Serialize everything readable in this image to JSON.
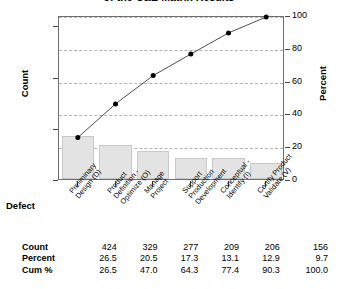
{
  "chart_data": {
    "type": "bar",
    "title": "of the C&E Matrix Results",
    "xlabel": "Defect",
    "ylabel": "Count",
    "y2label": "Percent",
    "categories": [
      "Preliminary Design (D)",
      "Product Definition - Optimize (O)",
      "Manage Project",
      "Support Production Development",
      "Conceptual - Identify (I)",
      "Certify Product Validate (V)"
    ],
    "category_lines": [
      [
        "Preliminary",
        "Design (D)"
      ],
      [
        "Product",
        "Definition -",
        "Optimize (O)"
      ],
      [
        "Manage",
        "Project"
      ],
      [
        "Support",
        "Production",
        "Development"
      ],
      [
        "Conceptual -",
        "Identify (I)"
      ],
      [
        "Certify Product",
        "Validate (V)"
      ]
    ],
    "values": [
      424,
      329,
      277,
      209,
      206,
      156
    ],
    "percent": [
      26.5,
      20.5,
      17.3,
      13.1,
      12.9,
      9.7
    ],
    "cum_percent": [
      26.5,
      47.0,
      64.3,
      77.4,
      90.3,
      100.0
    ],
    "ylim": [
      0,
      1600
    ],
    "y2lim": [
      0,
      100
    ],
    "yticks": [
      0,
      500,
      1000,
      1500
    ],
    "ytick_labels": [
      "0",
      "500",
      "1000",
      "1500"
    ],
    "y2ticks": [
      0,
      20,
      40,
      60,
      80,
      100
    ],
    "y2tick_labels": [
      "0",
      "20",
      "40",
      "60",
      "80",
      "100"
    ],
    "grid": true,
    "legend": "none",
    "series": [
      {
        "name": "Count",
        "type": "bar",
        "values": [
          424,
          329,
          277,
          209,
          206,
          156
        ]
      },
      {
        "name": "Cum %",
        "type": "line",
        "values": [
          26.5,
          47.0,
          64.3,
          77.4,
          90.3,
          100.0
        ]
      }
    ],
    "colors": {
      "bar_fill": "#e3e3e3",
      "bar_border": "#c9c9c9",
      "line": "#3b3b3b",
      "marker": "#000000",
      "gridline": "#b4b4b4",
      "frame": "#6e6e6e"
    }
  },
  "table": {
    "rows": [
      {
        "label": "Count",
        "values": [
          "424",
          "329",
          "277",
          "209",
          "206",
          "156"
        ]
      },
      {
        "label": "Percent",
        "values": [
          "26.5",
          "20.5",
          "17.3",
          "13.1",
          "12.9",
          "9.7"
        ]
      },
      {
        "label": "Cum %",
        "values": [
          "26.5",
          "47.0",
          "64.3",
          "77.4",
          "90.3",
          "100.0"
        ]
      }
    ]
  }
}
